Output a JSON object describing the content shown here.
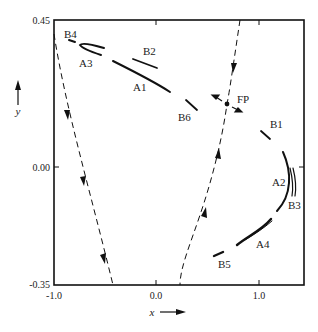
{
  "figure": {
    "type": "phase-portrait",
    "axes": {
      "x": {
        "label": "x",
        "ticks": [
          "-1.0",
          "0.0",
          "1.0"
        ],
        "range": [
          -1.0,
          1.45
        ]
      },
      "y": {
        "label": "y",
        "ticks": [
          "0.45",
          "0.00",
          "-0.35"
        ],
        "range": [
          -0.35,
          0.45
        ]
      }
    },
    "fixed_point": {
      "label": "FP",
      "x": 0.69,
      "y": 0.18
    },
    "trajectory_labels": {
      "A1": "A1",
      "A2": "A2",
      "A3": "A3",
      "A4": "A4",
      "B1": "B1",
      "B2": "B2",
      "B3": "B3",
      "B4": "B4",
      "B5": "B5",
      "B6": "B6"
    },
    "manifolds": {
      "stable": "dashed, arrows toward FP",
      "separatrix_left": "dashed, arrows downward"
    },
    "colors": {
      "ink": "#111111",
      "background": "#ffffff",
      "label": "#222222"
    }
  }
}
